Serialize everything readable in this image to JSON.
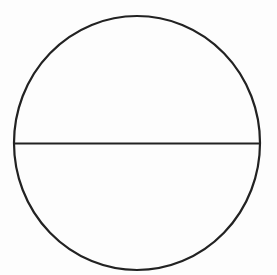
{
  "diagram": {
    "background": "#fdfdfd",
    "stroke_color": "#222222",
    "stroke_width": 2.2,
    "circle": {
      "cx": 137,
      "cy": 143,
      "rx": 123,
      "ry": 127
    },
    "diameter": {
      "x1": 14,
      "y1": 143.5,
      "x2": 260,
      "y2": 143.5
    }
  }
}
